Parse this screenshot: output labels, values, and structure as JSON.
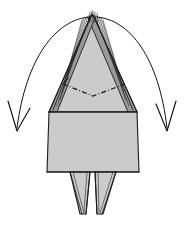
{
  "figure": {
    "caption": "",
    "background_color": "#ffffff",
    "width": 185,
    "height": 225
  },
  "palette": {
    "paper_gray": "#cbcbcb",
    "paper_shadow": "#9a9a9a",
    "ink": "#141414",
    "background": "#ffffff"
  },
  "shapes": {
    "top_point": {
      "name": "triangular-point",
      "description": "Large gray triangle tapering up to an apex, layered edges",
      "apex": {
        "x": 92,
        "y": 14
      },
      "base_left": {
        "x": 49,
        "y": 112
      },
      "base_right": {
        "x": 137,
        "y": 112
      },
      "fill": "#cbcbcb"
    },
    "body_box": {
      "name": "rectangular-body",
      "description": "Gray trapezoidal box forming the body of the model",
      "top_left": {
        "x": 49,
        "y": 112
      },
      "top_right": {
        "x": 137,
        "y": 112
      },
      "bottom_right": {
        "x": 139,
        "y": 172
      },
      "bottom_left": {
        "x": 47,
        "y": 172
      },
      "fill": "#cbcbcb"
    },
    "left_leg": {
      "name": "left-leg-flap",
      "description": "Narrow tapering flap hanging below body, left",
      "top_left": {
        "x": 70,
        "y": 172
      },
      "top_right": {
        "x": 90,
        "y": 172
      },
      "tip": {
        "x": 86,
        "y": 214
      },
      "fill": "#cbcbcb"
    },
    "right_leg": {
      "name": "right-leg-flap",
      "description": "Narrow tapering flap hanging below body, right",
      "top_left": {
        "x": 95,
        "y": 172
      },
      "top_right": {
        "x": 116,
        "y": 172
      },
      "tip": {
        "x": 99,
        "y": 214
      },
      "fill": "#cbcbcb"
    }
  },
  "fold_lines": {
    "chain_fold": {
      "name": "dash-dot-fold-line",
      "style": "dash-dot",
      "meaning": "fold line marker across the triangular point",
      "points": [
        {
          "x": 63,
          "y": 84
        },
        {
          "x": 93,
          "y": 96
        },
        {
          "x": 125,
          "y": 84
        }
      ]
    }
  },
  "arrows": [
    {
      "name": "left-unfold-arrow",
      "direction": "outward-left-down",
      "meaning": "pull / swing flap out to the left",
      "start": {
        "x": 90,
        "y": 17
      },
      "end": {
        "x": 17,
        "y": 130
      },
      "head_style": "open-v"
    },
    {
      "name": "right-unfold-arrow",
      "direction": "outward-right-down",
      "meaning": "pull / swing flap out to the right",
      "start": {
        "x": 96,
        "y": 17
      },
      "end": {
        "x": 167,
        "y": 130
      },
      "head_style": "open-v"
    }
  ],
  "layer_counts": {
    "top_left_spikes": 6,
    "top_right_spikes": 6,
    "left_leg_lines": 3,
    "right_leg_lines": 3
  }
}
